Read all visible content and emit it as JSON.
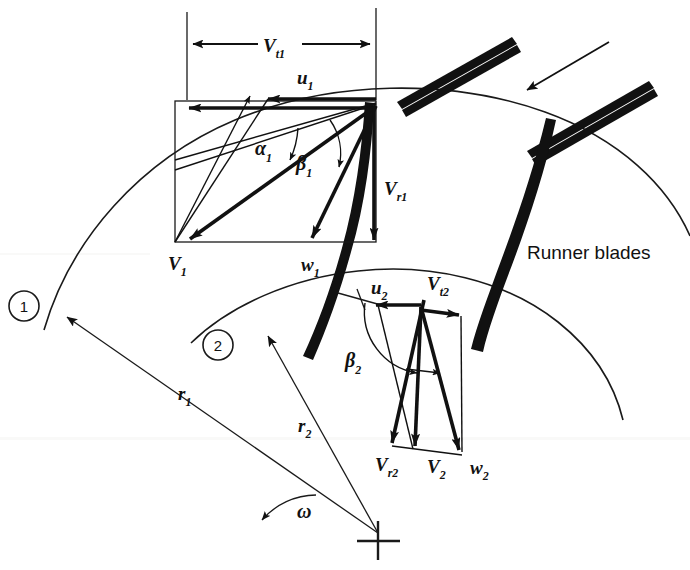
{
  "figure": {
    "title_semantic": "francis-turbine-velocity-diagram",
    "background_color": "#ffffff",
    "ink_color": "#111111"
  },
  "labels": {
    "v_t1": {
      "base": "V",
      "sub": "t1"
    },
    "u1": {
      "base": "u",
      "sub": "1"
    },
    "alpha1": {
      "base": "α",
      "sub": "1"
    },
    "beta1": {
      "base": "β",
      "sub": "1"
    },
    "v1": {
      "base": "V",
      "sub": "1"
    },
    "w1": {
      "base": "w",
      "sub": "1"
    },
    "v_r1": {
      "base": "V",
      "sub": "r1"
    },
    "u2": {
      "base": "u",
      "sub": "2"
    },
    "v_t2": {
      "base": "V",
      "sub": "t2"
    },
    "beta2": {
      "base": "β",
      "sub": "2"
    },
    "v_r2": {
      "base": "V",
      "sub": "r2"
    },
    "v2": {
      "base": "V",
      "sub": "2"
    },
    "w2": {
      "base": "w",
      "sub": "2"
    },
    "r1": {
      "base": "r",
      "sub": "1"
    },
    "r2": {
      "base": "r",
      "sub": "2"
    },
    "omega": {
      "base": "ω",
      "sub": ""
    },
    "runner_blades": "Runner blades"
  },
  "station_markers": [
    {
      "id": "1",
      "text": "1"
    },
    {
      "id": "2",
      "text": "2"
    }
  ],
  "components": {
    "guide_vanes_count": 2,
    "runner_blades_count": 2,
    "inflow_arrow": "flow-direction-arrow",
    "center_mark": "axis-center-crosshair"
  }
}
